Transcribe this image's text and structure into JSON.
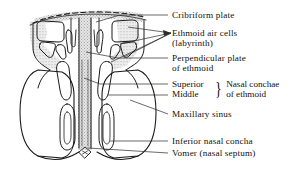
{
  "figure": {
    "kind": "anatomical-coronal-section",
    "ink_color": "#1a1a1a",
    "shading_color": "#d9d9d9",
    "background_color": "#ffffff"
  },
  "labels": {
    "cribriform_plate": "Cribriform plate",
    "ethmoid_air_cells_line1": "Ethmoid air cells",
    "ethmoid_air_cells_line2": "(labyrinth)",
    "perpendicular_plate_line1": "Perpendicular plate",
    "perpendicular_plate_line2": "of ethmoid",
    "superior": "Superior",
    "middle": "Middle",
    "nasal_conchae_line1": "Nasal conchae",
    "nasal_conchae_line2": "of ethmoid",
    "brace_glyph": "}",
    "maxillary_sinus": "Maxillary sinus",
    "inferior_nasal_concha": "Inferior nasal concha",
    "vomer": "Vomer (nasal septum)"
  },
  "structures": {
    "cribriform_plate": "cribriform-plate",
    "ethmoid_labyrinth_left": "ethmoid-air-cells-left",
    "ethmoid_labyrinth_right": "ethmoid-air-cells-right",
    "perpendicular_plate": "perpendicular-plate-of-ethmoid",
    "superior_concha_left": "superior-nasal-concha-left",
    "superior_concha_right": "superior-nasal-concha-right",
    "middle_concha_left": "middle-nasal-concha-left",
    "middle_concha_right": "middle-nasal-concha-right",
    "inferior_concha_left": "inferior-nasal-concha-left",
    "inferior_concha_right": "inferior-nasal-concha-right",
    "maxillary_sinus_left": "maxillary-sinus-left",
    "maxillary_sinus_right": "maxillary-sinus-right",
    "vomer": "vomer-nasal-septum",
    "nasal_crest_marker": "nasal-crest-marker"
  }
}
